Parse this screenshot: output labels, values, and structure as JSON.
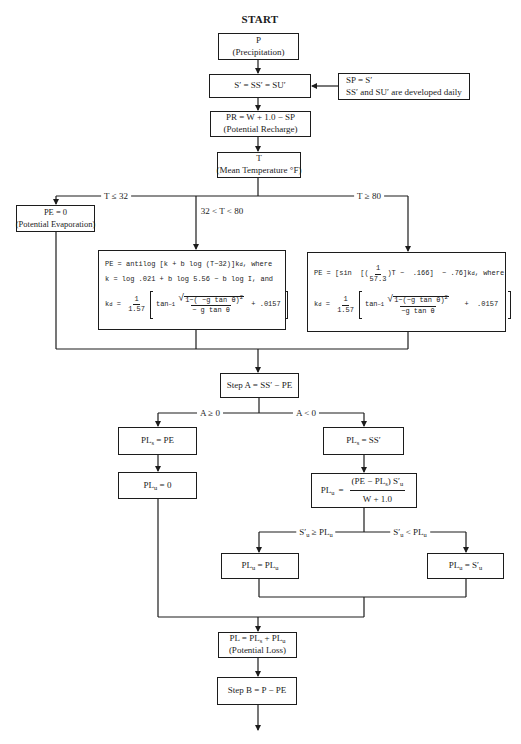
{
  "diagram": {
    "start_label": "START",
    "precipitation": {
      "symbol": "P",
      "caption": "(Precipitation)"
    },
    "storage": {
      "text": "S′ = SS′ = SU′"
    },
    "storage_note": {
      "line1": "SP = S′",
      "line2": "SS′ and SU′ are developed daily"
    },
    "recharge": {
      "formula": "PR = W + 1.0 − SP",
      "caption": "(Potential Recharge)"
    },
    "temperature": {
      "symbol": "T",
      "caption": "(Mean Temperature °F)"
    },
    "pe_low": {
      "formula": "PE = 0",
      "caption": "(Potential Evaporation)"
    },
    "pe_mid": {
      "line1_a": "PE = antilog [k + b log (T−32)]k",
      "line1_sub": "d",
      "line1_b": ", where",
      "line2": "k = log .021 + b log 5.56 − b log I, and",
      "kd": {
        "lhs": "k",
        "lhs_sub": "d",
        "eq": " = ",
        "coef_num": "1",
        "coef_den": "1.57",
        "fn": "tan",
        "fn_sup": "−1",
        "radicand": "1−( −g tan θ)",
        "radicand_sup": "2",
        "denominator": "− g tan θ",
        "tail": " + .0157"
      }
    },
    "pe_high": {
      "line1_a": "PE = [sin  [(",
      "line1_frac_num": "1",
      "line1_frac_den": "57.3",
      "line1_b": ")T −  .166]  − .76]k",
      "line1_sub": "d",
      "line1_c": ", where",
      "kd": {
        "lhs": "k",
        "lhs_sub": "d",
        "eq": " = ",
        "coef_num": "1",
        "coef_den": "1.57",
        "fn": "tan",
        "fn_sup": "−1",
        "radicand": "1−(−g tan θ)",
        "radicand_sup": "2",
        "denominator": "−g tan θ",
        "tail": "   +  .0157"
      }
    },
    "step_a": {
      "text": "Step A = SS′ − PE"
    },
    "pl_s_pe": {
      "lhs": "PL",
      "lhs_sub": "s",
      "rhs": " = PE"
    },
    "pl_u_zero": {
      "lhs": "PL",
      "lhs_sub": "u",
      "rhs": " = 0"
    },
    "pl_s_ss": {
      "lhs": "PL",
      "lhs_sub": "s",
      "rhs": " = SS′"
    },
    "pl_u_calc": {
      "lhs": "PL",
      "lhs_sub": "u",
      "eq": "=",
      "num_a": "(PE − PL",
      "num_sub": "s",
      "num_b": ") S′",
      "num_sub2": "u",
      "den": "W + 1.0"
    },
    "pl_u_keep": {
      "lhs": "PL",
      "lhs_sub": "u",
      "eq": " = ",
      "rhs": "PL",
      "rhs_sub": "u"
    },
    "pl_u_su": {
      "lhs": "PL",
      "lhs_sub": "u",
      "eq": " = ",
      "rhs": "S′",
      "rhs_sub": "u"
    },
    "potential_loss": {
      "a": "PL = PL",
      "a_sub": "s",
      "b": " + PL",
      "b_sub": "u",
      "caption": "(Potential Loss)"
    },
    "step_b": {
      "text": "Step B = P − PE"
    }
  },
  "edges": {
    "t_low": "T ≤ 32",
    "t_mid": "32 < T < 80",
    "t_high": "T ≥ 80",
    "a_nonneg": "A ≥ 0",
    "a_neg": "A < 0",
    "su_ge": {
      "a": "S′",
      "a_sub": "u",
      "op": " ≥ ",
      "b": "PL",
      "b_sub": "u"
    },
    "su_lt": {
      "a": "S′",
      "a_sub": "u",
      "op": " < ",
      "b": "PL",
      "b_sub": "u"
    }
  },
  "colors": {
    "ink": "#1c1c1c",
    "paper": "#ffffff"
  }
}
